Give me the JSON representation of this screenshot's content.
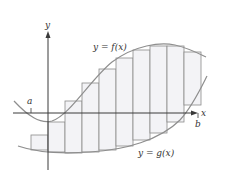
{
  "diagram": {
    "labels": {
      "y_axis": "y",
      "x_axis": "x",
      "a": "a",
      "b": "b",
      "f_curve": "y = f(x)",
      "g_curve": "y = g(x)"
    },
    "colors": {
      "axis": "#3a3a3a",
      "curve": "#8e8e8e",
      "rect_fill": "#f3f3f6",
      "rect_stroke": "#8a8a8a",
      "text": "#333333"
    },
    "rectangle_count": 10,
    "rectangles": [
      {
        "x": 31,
        "top": 135,
        "bottom": 150
      },
      {
        "x": 48,
        "top": 122,
        "bottom": 152
      },
      {
        "x": 65,
        "top": 101,
        "bottom": 153
      },
      {
        "x": 82,
        "top": 83,
        "bottom": 152
      },
      {
        "x": 99,
        "top": 69,
        "bottom": 150
      },
      {
        "x": 116,
        "top": 58,
        "bottom": 146
      },
      {
        "x": 133,
        "top": 50,
        "bottom": 140
      },
      {
        "x": 150,
        "top": 46,
        "bottom": 133
      },
      {
        "x": 167,
        "top": 46,
        "bottom": 122
      },
      {
        "x": 184,
        "top": 52,
        "bottom": 105
      }
    ]
  }
}
